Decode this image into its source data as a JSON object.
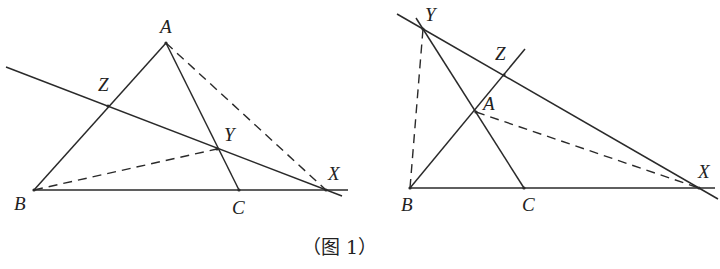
{
  "caption": "（图 1）",
  "figures": [
    {
      "id": "left",
      "points": {
        "A": {
          "label": "A",
          "x": 166,
          "y": 43,
          "lx": 160,
          "ly": 33
        },
        "B": {
          "label": "B",
          "x": 34,
          "y": 190,
          "lx": 14,
          "ly": 210
        },
        "C": {
          "label": "C",
          "x": 239,
          "y": 190,
          "lx": 232,
          "ly": 214
        },
        "X": {
          "label": "X",
          "x": 326,
          "y": 190,
          "lx": 328,
          "ly": 180
        },
        "Y": {
          "label": "Y",
          "x": 217,
          "y": 149,
          "lx": 224,
          "ly": 141
        },
        "Z": {
          "label": "Z",
          "x": 108,
          "y": 106,
          "lx": 98,
          "ly": 91
        }
      },
      "solid_segments": [
        [
          34,
          190,
          166,
          43
        ],
        [
          166,
          43,
          239,
          190
        ],
        [
          34,
          190,
          348,
          190
        ],
        [
          6,
          67,
          342,
          196
        ]
      ],
      "dashed_segments": [
        [
          166,
          43,
          326,
          190
        ],
        [
          34,
          190,
          217,
          149
        ]
      ]
    },
    {
      "id": "right",
      "points": {
        "A": {
          "label": "A",
          "x": 476,
          "y": 112,
          "lx": 483,
          "ly": 110
        },
        "B": {
          "label": "B",
          "x": 410,
          "y": 188,
          "lx": 401,
          "ly": 211
        },
        "C": {
          "label": "C",
          "x": 524,
          "y": 188,
          "lx": 522,
          "ly": 211
        },
        "X": {
          "label": "X",
          "x": 699,
          "y": 188,
          "lx": 698,
          "ly": 178
        },
        "Y": {
          "label": "Y",
          "x": 423,
          "y": 29,
          "lx": 425,
          "ly": 21
        },
        "Z": {
          "label": "Z",
          "x": 504,
          "y": 75,
          "lx": 495,
          "ly": 60
        }
      },
      "solid_segments": [
        [
          410,
          188,
          525,
          49
        ],
        [
          416,
          18,
          524,
          188
        ],
        [
          410,
          188,
          715,
          188
        ],
        [
          397,
          14,
          718,
          199
        ]
      ],
      "dashed_segments": [
        [
          410,
          188,
          423,
          29
        ],
        [
          476,
          112,
          699,
          188
        ]
      ]
    }
  ]
}
